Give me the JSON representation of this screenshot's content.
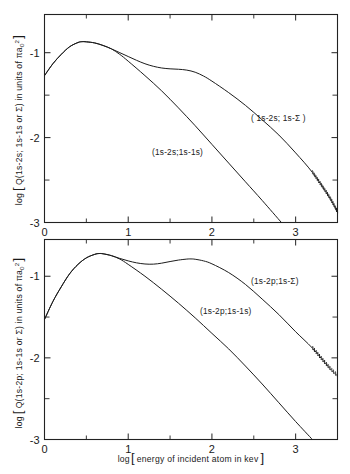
{
  "figure": {
    "background_color": "#ffffff",
    "ink_color": "#1c1c1c"
  },
  "axes": {
    "x_label_prefix": "log",
    "x_label_bracketed": "energy of incident atom in kev",
    "x_ticks": [
      "0",
      "1",
      "2",
      "3"
    ],
    "x_tick_values": [
      0,
      1,
      2,
      3
    ],
    "x_minor_tick_values": [
      0.5,
      1.5,
      2.5,
      3.5
    ],
    "x_range": [
      0,
      3.5
    ],
    "y_ticks": [
      "-1",
      "-2",
      "-3"
    ],
    "y_tick_values": [
      -1,
      -2,
      -3
    ],
    "y_minor_tick_values": [
      -0.5,
      -1.5,
      -2.5
    ],
    "y_range": [
      -3,
      -0.55
    ]
  },
  "panels": [
    {
      "id": "top",
      "y_axis_title_prefix": "log",
      "y_axis_title_main": "Q(1s-2s; 1s-1s or ",
      "y_axis_title_sigma": "Σ",
      "y_axis_title_tail": ") in units of πa",
      "y_axis_title_sub": "0",
      "y_axis_title_sup": "2",
      "curve_labels": {
        "sigma": "( 1s-2s; 1s-Σ )",
        "elastic": "(1s-2s;1s-1s)"
      }
    },
    {
      "id": "bottom",
      "y_axis_title_prefix": "log",
      "y_axis_title_main": "Q(1s-2p; 1s-1s or ",
      "y_axis_title_sigma": "Σ",
      "y_axis_title_tail": ") in units of πa",
      "y_axis_title_sub": "0",
      "y_axis_title_sup": "2",
      "curve_labels": {
        "sigma": "(1s-2p;1s-Σ)",
        "elastic": "(1s-2p;1s-1s)"
      }
    }
  ],
  "chart_data": [
    {
      "type": "line",
      "panel": "top",
      "title": "",
      "xlabel": "log[ energy of incident atom in kev ]",
      "ylabel": "log [ Q(1s-2s; 1s-1s or Σ) in units of πa₀² ]",
      "xlim": [
        0,
        3.5
      ],
      "ylim": [
        -3,
        -0.55
      ],
      "grid": false,
      "legend_position": "inline-annotations",
      "series": [
        {
          "name": "(1s-2s; 1s-Σ)",
          "x": [
            0.0,
            0.1,
            0.2,
            0.3,
            0.4,
            0.45,
            0.5,
            0.6,
            0.7,
            0.8,
            0.9,
            1.0,
            1.1,
            1.2,
            1.3,
            1.4,
            1.5,
            1.6,
            1.7,
            1.8,
            1.9,
            2.0,
            2.2,
            2.4,
            2.6,
            2.8,
            3.0,
            3.2,
            3.4,
            3.5
          ],
          "y": [
            -1.27,
            -1.13,
            -1.02,
            -0.93,
            -0.88,
            -0.87,
            -0.872,
            -0.885,
            -0.915,
            -0.955,
            -1.0,
            -1.045,
            -1.09,
            -1.13,
            -1.16,
            -1.18,
            -1.19,
            -1.195,
            -1.205,
            -1.23,
            -1.275,
            -1.335,
            -1.47,
            -1.62,
            -1.79,
            -1.97,
            -2.18,
            -2.41,
            -2.7,
            -2.88
          ]
        },
        {
          "name": "(1s-2s; 1s-1s)",
          "x": [
            0.0,
            0.1,
            0.2,
            0.3,
            0.4,
            0.45,
            0.5,
            0.6,
            0.7,
            0.8,
            0.9,
            1.0,
            1.2,
            1.4,
            1.6,
            1.8,
            2.0,
            2.2,
            2.4,
            2.6,
            2.83
          ],
          "y": [
            -1.27,
            -1.13,
            -1.02,
            -0.93,
            -0.88,
            -0.87,
            -0.872,
            -0.885,
            -0.915,
            -0.955,
            -1.02,
            -1.1,
            -1.27,
            -1.45,
            -1.65,
            -1.86,
            -2.08,
            -2.3,
            -2.52,
            -2.74,
            -3.0
          ]
        }
      ],
      "annotations": [
        {
          "text": "( 1s-2s; 1s-Σ )",
          "x": 2.55,
          "y": -1.92
        },
        {
          "text": "(1s-2s;1s-1s)",
          "x": 1.5,
          "y": -2.2
        }
      ],
      "uncertainty_band": {
        "series": "(1s-2s; 1s-Σ)",
        "x_start": 3.12,
        "x_end": 3.5,
        "style": "hatched-double-line"
      }
    },
    {
      "type": "line",
      "panel": "bottom",
      "title": "",
      "xlabel": "log[ energy of incident atom in kev ]",
      "ylabel": "log [ Q(1s-2p; 1s-1s or Σ) in units of πa₀² ]",
      "xlim": [
        0,
        3.5
      ],
      "ylim": [
        -3,
        -0.55
      ],
      "grid": false,
      "legend_position": "inline-annotations",
      "series": [
        {
          "name": "(1s-2p; 1s-Σ)",
          "x": [
            0.0,
            0.1,
            0.2,
            0.3,
            0.4,
            0.5,
            0.6,
            0.65,
            0.7,
            0.8,
            0.9,
            1.0,
            1.1,
            1.2,
            1.3,
            1.4,
            1.5,
            1.6,
            1.7,
            1.75,
            1.8,
            1.9,
            2.0,
            2.2,
            2.4,
            2.6,
            2.8,
            3.0,
            3.2,
            3.4,
            3.5
          ],
          "y": [
            -1.53,
            -1.31,
            -1.13,
            -0.97,
            -0.855,
            -0.775,
            -0.732,
            -0.722,
            -0.725,
            -0.748,
            -0.782,
            -0.812,
            -0.836,
            -0.85,
            -0.852,
            -0.84,
            -0.82,
            -0.802,
            -0.79,
            -0.788,
            -0.792,
            -0.812,
            -0.848,
            -0.955,
            -1.1,
            -1.28,
            -1.47,
            -1.68,
            -1.88,
            -2.12,
            -2.22
          ]
        },
        {
          "name": "(1s-2p; 1s-1s)",
          "x": [
            0.0,
            0.1,
            0.2,
            0.3,
            0.4,
            0.5,
            0.6,
            0.65,
            0.7,
            0.8,
            0.9,
            1.0,
            1.2,
            1.4,
            1.6,
            1.8,
            2.0,
            2.2,
            2.4,
            2.6,
            2.8,
            3.0,
            3.2
          ],
          "y": [
            -1.53,
            -1.31,
            -1.13,
            -0.97,
            -0.855,
            -0.775,
            -0.732,
            -0.722,
            -0.725,
            -0.748,
            -0.79,
            -0.855,
            -1.0,
            -1.16,
            -1.33,
            -1.51,
            -1.7,
            -1.89,
            -2.1,
            -2.32,
            -2.55,
            -2.78,
            -3.0
          ]
        }
      ],
      "annotations": [
        {
          "text": "(1s-2p;1s-Σ)",
          "x": 2.55,
          "y": -1.18
        },
        {
          "text": "(1s-2p;1s-1s)",
          "x": 1.82,
          "y": -1.46
        }
      ],
      "uncertainty_band": {
        "series": "(1s-2p; 1s-Σ)",
        "x_start": 3.05,
        "x_end": 3.5,
        "style": "hatched-double-line"
      }
    }
  ]
}
